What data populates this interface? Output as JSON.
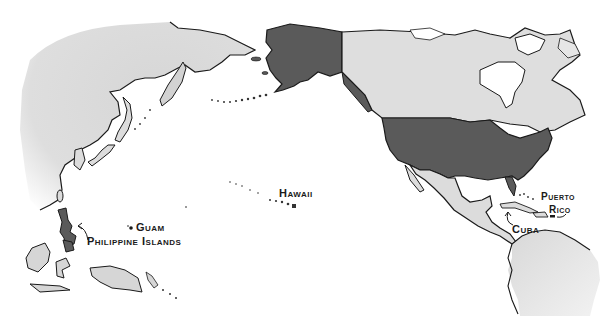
{
  "map": {
    "title": "",
    "colors": {
      "us_territory": "#5a5a5a",
      "foreign_land": "#d9d9d9",
      "land_light": "#e6e6e6",
      "ocean": "#ffffff",
      "outline": "#1a1a1a"
    },
    "labels": {
      "hawaii": "Hawaii",
      "guam": "Guam",
      "philippines": "Philippine Islands",
      "puerto_rico_line1": "Puerto",
      "puerto_rico_line2": "Rico",
      "cuba": "Cuba"
    },
    "regions": [
      {
        "name": "Alaska",
        "type": "us_territory"
      },
      {
        "name": "United States",
        "type": "us_territory"
      },
      {
        "name": "Hawaii",
        "type": "us_territory"
      },
      {
        "name": "Guam",
        "type": "us_territory"
      },
      {
        "name": "Philippine Islands",
        "type": "us_territory"
      },
      {
        "name": "Puerto Rico",
        "type": "us_territory"
      },
      {
        "name": "Canada",
        "type": "foreign_land"
      },
      {
        "name": "Asia",
        "type": "foreign_land"
      },
      {
        "name": "Mexico / Central America",
        "type": "foreign_land"
      },
      {
        "name": "South America",
        "type": "foreign_land"
      },
      {
        "name": "Cuba",
        "type": "foreign_land"
      }
    ]
  }
}
